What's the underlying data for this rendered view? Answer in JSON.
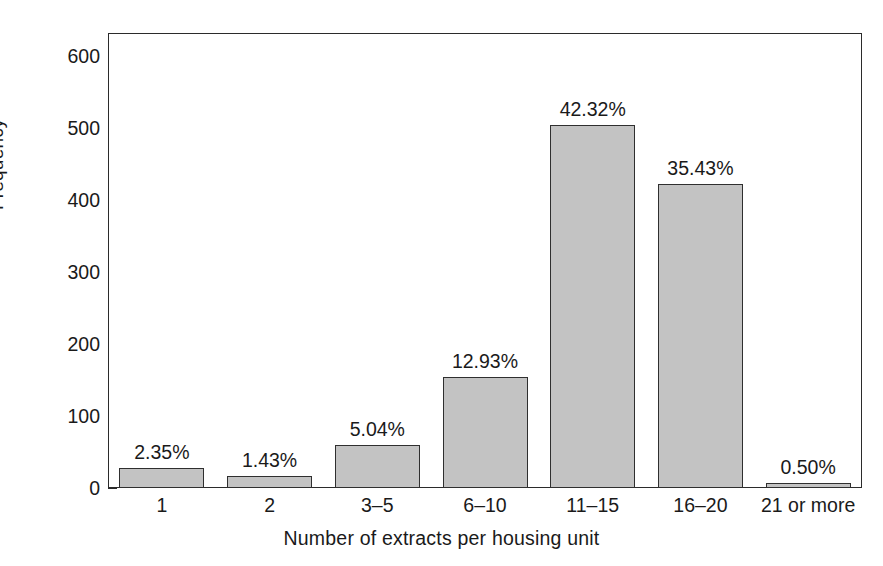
{
  "chart_data": {
    "type": "bar",
    "title": "",
    "xlabel": "Number of extracts per housing unit",
    "ylabel": "Frequency",
    "categories": [
      "1",
      "2",
      "3–5",
      "6–10",
      "11–15",
      "16–20",
      "21 or more"
    ],
    "values": [
      28,
      17,
      60,
      154,
      504,
      422,
      6
    ],
    "data_labels": [
      "2.35%",
      "1.43%",
      "5.04%",
      "12.93%",
      "42.32%",
      "35.43%",
      "0.50%"
    ],
    "percentages": [
      2.35,
      1.43,
      5.04,
      12.93,
      42.32,
      35.43,
      0.5
    ],
    "ylim": [
      0,
      632
    ],
    "y_ticks": [
      0,
      100,
      200,
      300,
      400,
      500,
      600
    ],
    "y_tick_labels": [
      "0",
      "100",
      "200",
      "300",
      "400",
      "500",
      "600"
    ],
    "y_minor_tick_step": 20,
    "grid": false,
    "legend": false,
    "bar_color": "#c3c3c3",
    "bar_edge_color": "#2f2f2f",
    "axis_color": "#2b2b2b",
    "background": "#ffffff"
  }
}
